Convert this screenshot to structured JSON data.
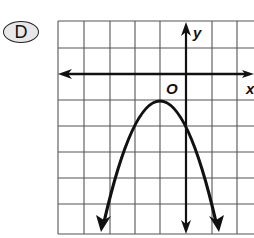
{
  "choice_label": "D",
  "graph": {
    "x_axis_label": "x",
    "y_axis_label": "y",
    "origin_label": "O",
    "grid": {
      "x_lines": [
        58,
        84,
        110,
        135,
        160,
        186,
        212,
        237
      ],
      "y_lines": [
        21,
        48,
        74,
        100,
        126,
        152,
        178,
        204,
        234
      ]
    },
    "axes": {
      "x_axis_y": 74,
      "y_axis_x": 186
    },
    "curve": {
      "type": "parabola",
      "opens": "down",
      "vertex": [
        -1,
        -1
      ],
      "equation": "y = -(x+1)^2 - 1"
    }
  },
  "colors": {
    "ink": "#111111",
    "grid": "#555555",
    "badge_fill": "#e8e8e8"
  }
}
